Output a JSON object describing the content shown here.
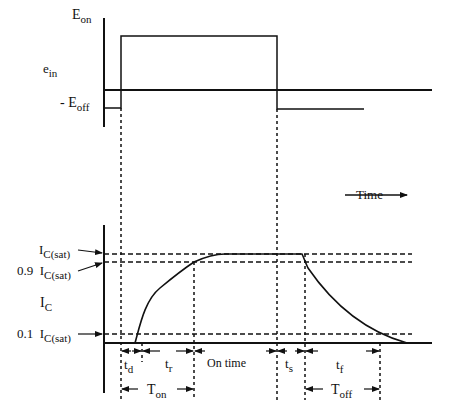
{
  "diagram": {
    "input_waveform": {
      "axis_label": "e",
      "axis_label_sub": "in",
      "levels": [
        {
          "label": "E",
          "sub": "on"
        },
        {
          "label": "- E",
          "sub": "off"
        }
      ]
    },
    "output_waveform": {
      "axis_label": "I",
      "axis_label_sub": "C",
      "levels": [
        {
          "prefix": "",
          "label": "I",
          "sub": "C(sat)"
        },
        {
          "prefix": "0.9",
          "label": "I",
          "sub": "C(sat)"
        },
        {
          "prefix": "0.1",
          "label": "I",
          "sub": "C(sat)"
        }
      ],
      "time_axis_label": "Time"
    },
    "intervals": [
      {
        "label": "t",
        "sub": "d"
      },
      {
        "label": "t",
        "sub": "r"
      },
      {
        "label": "On time",
        "sub": ""
      },
      {
        "label": "t",
        "sub": "s"
      },
      {
        "label": "t",
        "sub": "f"
      }
    ],
    "spans": [
      {
        "label": "T",
        "sub": "on"
      },
      {
        "label": "T",
        "sub": "off"
      }
    ]
  },
  "colors": {
    "ink": "#111111",
    "background": "#ffffff"
  }
}
